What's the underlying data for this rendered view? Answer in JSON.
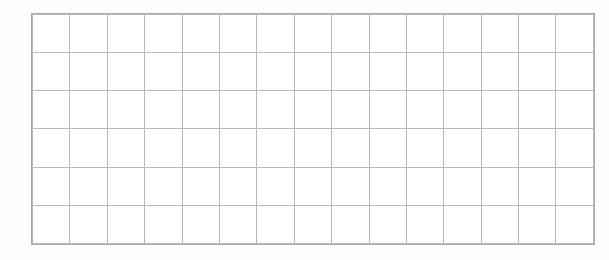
{
  "document": {
    "type": "blank-grid-table",
    "description": "Scanned blank ruled grid table",
    "background_color": "#ffffff",
    "page_tint": "#fefefe"
  },
  "grid": {
    "columns": 15,
    "rows": 6,
    "bounds": {
      "left": 32,
      "top": 14,
      "width": 546,
      "height": 229
    },
    "cell_width": 36.4,
    "cell_height": 38.2,
    "line_color": "#b9b9b9",
    "border_color": "#a9a9a9",
    "line_width": 1,
    "cell_fill": "#ffffff",
    "cells": [
      [
        "",
        "",
        "",
        "",
        "",
        "",
        "",
        "",
        "",
        "",
        "",
        "",
        "",
        "",
        ""
      ],
      [
        "",
        "",
        "",
        "",
        "",
        "",
        "",
        "",
        "",
        "",
        "",
        "",
        "",
        "",
        ""
      ],
      [
        "",
        "",
        "",
        "",
        "",
        "",
        "",
        "",
        "",
        "",
        "",
        "",
        "",
        "",
        ""
      ],
      [
        "",
        "",
        "",
        "",
        "",
        "",
        "",
        "",
        "",
        "",
        "",
        "",
        "",
        "",
        ""
      ],
      [
        "",
        "",
        "",
        "",
        "",
        "",
        "",
        "",
        "",
        "",
        "",
        "",
        "",
        "",
        ""
      ],
      [
        "",
        "",
        "",
        "",
        "",
        "",
        "",
        "",
        "",
        "",
        "",
        "",
        "",
        "",
        ""
      ]
    ]
  }
}
